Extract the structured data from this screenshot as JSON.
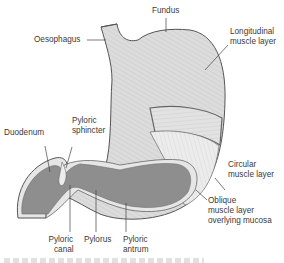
{
  "diagram": {
    "labels": {
      "fundus": "Fundus",
      "oesophagus": "Oesophagus",
      "longitudinal": [
        "Longitudinal",
        "muscle layer"
      ],
      "duodenum": "Duodenum",
      "pyloric_sphincter": [
        "Pyloric",
        "sphincter"
      ],
      "circular": [
        "Circular",
        "muscle layer"
      ],
      "oblique": [
        "Oblique",
        "muscle layer",
        "overlying mucosa"
      ],
      "pyloric_canal": [
        "Pyloric",
        "canal"
      ],
      "pylorus": "Pylorus",
      "pyloric_antrum": [
        "Pyloric",
        "antrum"
      ]
    },
    "colors": {
      "outer_muscle": "#d9d9d9",
      "outline": "#555555",
      "mucosa": "#8e8e8e",
      "mucosa_rim": "#e6e6e6",
      "leader": "#444444"
    }
  }
}
